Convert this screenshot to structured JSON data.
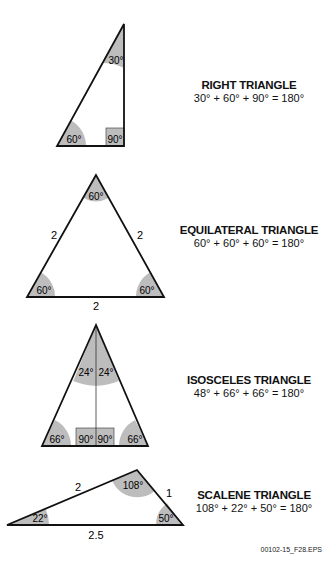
{
  "right": {
    "title": "RIGHT TRIANGLE",
    "equation": "30° + 60° + 90° = 180°",
    "angles": {
      "top": "30°",
      "left": "60°",
      "right": "90°"
    }
  },
  "equilateral": {
    "title": "EQUILATERAL TRIANGLE",
    "equation": "60° + 60° + 60° = 180°",
    "angles": {
      "top": "60°",
      "left": "60°",
      "right": "60°"
    },
    "sides": {
      "left": "2",
      "right": "2",
      "bottom": "2"
    }
  },
  "isosceles": {
    "title": "ISOSCELES TRIANGLE",
    "equation": "48° + 66° + 66° = 180°",
    "angles": {
      "top_left": "24°",
      "top_right": "24°",
      "left": "66°",
      "right": "66°",
      "mid_left": "90°",
      "mid_right": "90°"
    }
  },
  "scalene": {
    "title": "SCALENE TRIANGLE",
    "equation": "108° + 22° + 50° = 180°",
    "angles": {
      "top": "108°",
      "left": "22°",
      "right": "50°"
    },
    "sides": {
      "top_left": "2",
      "top_right": "1",
      "bottom": "2.5"
    }
  },
  "figure_code": "00102-15_F28.EPS"
}
